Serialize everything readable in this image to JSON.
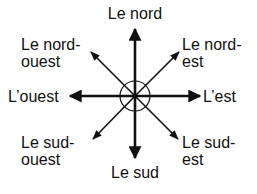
{
  "diagram": {
    "colors": {
      "ink": "#111111",
      "background": "#ffffff"
    },
    "center": {
      "x": 135,
      "y": 96,
      "circle_radius": 15
    },
    "directions": {
      "north": {
        "line1": "Le nord",
        "line2": ""
      },
      "south": {
        "line1": "Le sud",
        "line2": ""
      },
      "east": {
        "line1": "L’est",
        "line2": ""
      },
      "west": {
        "line1": "L’ouest",
        "line2": ""
      },
      "northeast": {
        "line1": "Le nord-",
        "line2": "est"
      },
      "northwest": {
        "line1": "Le nord-",
        "line2": "ouest"
      },
      "southeast": {
        "line1": "Le sud-",
        "line2": "est"
      },
      "southwest": {
        "line1": "Le sud-",
        "line2": "ouest"
      }
    }
  }
}
